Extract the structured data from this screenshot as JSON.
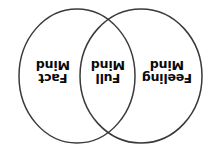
{
  "diagram": {
    "type": "venn",
    "orientation": "text rotated 180 degrees (upside down)",
    "background_color": "#ffffff",
    "stroke_color": "#3a3a3a",
    "text_color": "#0a0a0a",
    "sets": [
      {
        "id": "left",
        "region": "left-only",
        "label_lines": [
          "Fact",
          "Mind"
        ],
        "label_text": "Fact Mind",
        "center_x": 77,
        "center_y": 76,
        "radius_x": 58,
        "radius_y": 67
      },
      {
        "id": "right",
        "region": "right-only",
        "label_lines": [
          "Feeling",
          "Mind"
        ],
        "label_text": "Feeling Mind",
        "center_x": 141,
        "center_y": 76,
        "radius_x": 61,
        "radius_y": 67
      }
    ],
    "intersection": {
      "id": "center",
      "region": "overlap",
      "label_lines": [
        "Full",
        "Mind"
      ],
      "label_text": "Full Mind"
    }
  }
}
